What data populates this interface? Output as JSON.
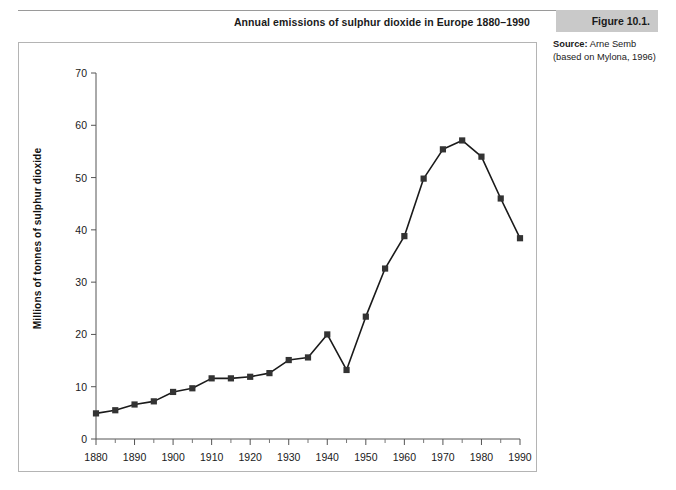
{
  "header": {
    "title": "Annual emissions of sulphur dioxide in Europe 1880–1990",
    "figure_tag": "Figure 10.1."
  },
  "source": {
    "label": "Source:",
    "name": " Arne Semb",
    "line2": "(based on Mylona, 1996)"
  },
  "chart_data": {
    "type": "line",
    "title": "Annual emissions of sulphur dioxide in Europe 1880–1990",
    "xlabel": "",
    "ylabel": "Millions of tonnes of sulphur dioxide",
    "xlim": [
      1880,
      1990
    ],
    "ylim": [
      0,
      70
    ],
    "grid": false,
    "legend": "none",
    "marker": "square",
    "line_color": "#1a1a1a",
    "marker_color": "#333333",
    "x_ticks": [
      1880,
      1890,
      1900,
      1910,
      1920,
      1930,
      1940,
      1950,
      1960,
      1970,
      1980,
      1990
    ],
    "x_minor_ticks": [
      1885,
      1895,
      1905,
      1915,
      1925,
      1935,
      1945,
      1955,
      1965,
      1975,
      1985
    ],
    "y_ticks": [
      0,
      10,
      20,
      30,
      40,
      50,
      60,
      70
    ],
    "x": [
      1880,
      1885,
      1890,
      1895,
      1900,
      1905,
      1910,
      1915,
      1920,
      1925,
      1930,
      1935,
      1940,
      1945,
      1950,
      1955,
      1960,
      1965,
      1970,
      1975,
      1980,
      1985,
      1990
    ],
    "values": [
      4.9,
      5.5,
      6.6,
      7.2,
      9.0,
      9.7,
      11.6,
      11.6,
      11.9,
      12.6,
      15.1,
      15.6,
      20.0,
      13.2,
      23.4,
      32.6,
      38.8,
      49.8,
      55.4,
      57.1,
      54.0,
      46.0,
      38.4
    ],
    "series": [
      {
        "name": "Sulphur dioxide emissions",
        "values": [
          4.9,
          5.5,
          6.6,
          7.2,
          9.0,
          9.7,
          11.6,
          11.6,
          11.9,
          12.6,
          15.1,
          15.6,
          20.0,
          13.2,
          23.4,
          32.6,
          38.8,
          49.8,
          55.4,
          57.1,
          54.0,
          46.0,
          38.4
        ]
      }
    ]
  }
}
